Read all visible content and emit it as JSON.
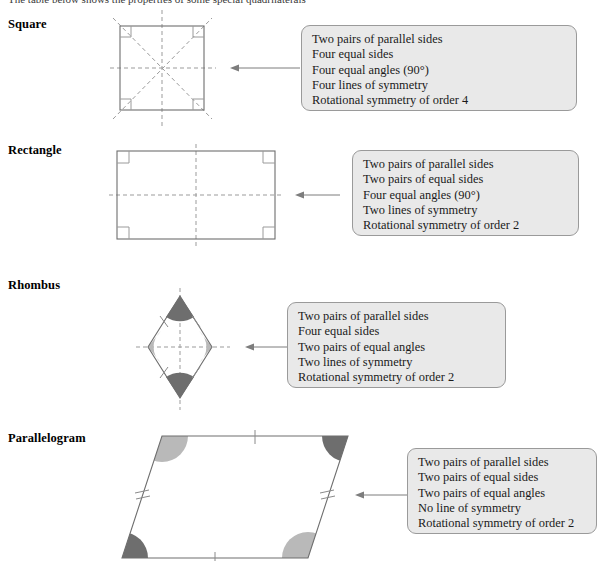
{
  "page": {
    "title_cutoff": "The table below shows the properties of some special quadrilaterals",
    "width": 603,
    "height": 561,
    "background": "#ffffff"
  },
  "style": {
    "callout_fill": "#e9e9e9",
    "callout_border": "#9a9a9a",
    "shape_stroke": "#6e6e6e",
    "dash_color": "#9b9b9b",
    "arrow_color": "#7d7d7d",
    "angle_dark": "#6e6e6e",
    "angle_light": "#b9b9b9"
  },
  "sections": [
    {
      "id": "square",
      "label": "Square",
      "shape_type": "square",
      "properties": [
        "Two pairs of parallel sides",
        "Four equal sides",
        "Four equal angles (90°)",
        "Four lines of symmetry",
        "Rotational symmetry of order 4"
      ]
    },
    {
      "id": "rectangle",
      "label": "Rectangle",
      "shape_type": "rectangle",
      "properties": [
        "Two pairs of parallel sides",
        "Two pairs of equal sides",
        "Four equal angles (90°)",
        "Two lines of symmetry",
        "Rotational symmetry of order 2"
      ]
    },
    {
      "id": "rhombus",
      "label": "Rhombus",
      "shape_type": "rhombus",
      "properties": [
        "Two pairs of parallel sides",
        "Four equal sides",
        "Two pairs of equal angles",
        "Two lines of symmetry",
        "Rotational symmetry of order 2"
      ]
    },
    {
      "id": "parallelogram",
      "label": "Parallelogram",
      "shape_type": "parallelogram",
      "properties": [
        "Two pairs of parallel sides",
        "Two pairs of equal sides",
        "Two pairs of equal angles",
        "No line of symmetry",
        "Rotational symmetry of order 2"
      ]
    }
  ]
}
